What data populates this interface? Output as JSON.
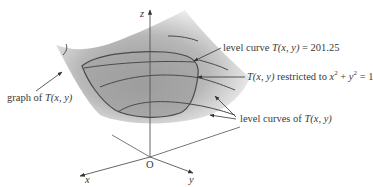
{
  "diagram": {
    "axes": {
      "z_label": "z",
      "x_label": "x",
      "y_label": "y",
      "origin_label": "O"
    },
    "labels": {
      "level_curve": {
        "prefix": "level curve ",
        "func": "T(x, y)",
        "suffix": " = 201.25"
      },
      "restricted": {
        "func": "T(x, y)",
        "middle": " restricted to ",
        "x": "x",
        "exp1": "2",
        "plus": " + ",
        "y": "y",
        "exp2": "2",
        "suffix": " = 1"
      },
      "graph": {
        "prefix": "graph of ",
        "func": "T(x, y)"
      },
      "level_curves": {
        "prefix": "level curves of ",
        "func": "T(x, y)"
      }
    },
    "colors": {
      "surface_dark": "#8c8c8c",
      "surface_light": "#e6e6e6",
      "curve": "#4a4a4a",
      "axis": "#555555",
      "text": "#3a3a3a"
    }
  }
}
